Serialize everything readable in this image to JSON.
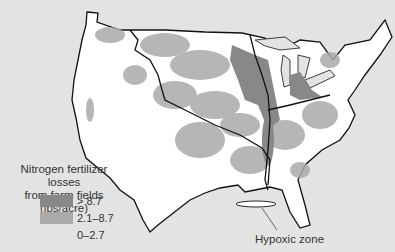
{
  "map": {
    "title": "Nitrogen fertilizer losses from farm fields",
    "colors": {
      "background": "#e3e3e3",
      "land": "#ffffff",
      "low": "#ffffff",
      "medium": "#aaaaaa",
      "high": "#888888",
      "border": "#111111",
      "state_lines": "#666666"
    }
  },
  "legend": {
    "title_line1": "Nitrogen fertilizer losses",
    "title_line2": "from farm fields (lbs/acre)",
    "items": [
      {
        "label": "> 8.7",
        "color": "#888888"
      },
      {
        "label": "2.1–8.7",
        "color": "#aaaaaa"
      },
      {
        "label": "0–2.7",
        "color": "#e3e3e3"
      }
    ]
  },
  "annotations": {
    "hypoxic_zone": "Hypoxic zone"
  }
}
